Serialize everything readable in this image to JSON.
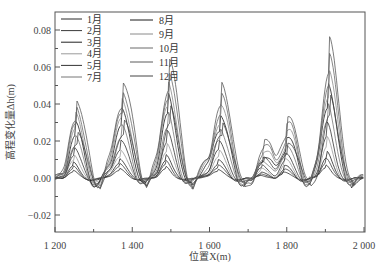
{
  "chart_data": {
    "type": "line",
    "title": "",
    "xlabel": "位置X(m)",
    "ylabel": "高程变化量Δh(m)",
    "xlim": [
      1200,
      2000
    ],
    "ylim": [
      -0.025,
      0.09
    ],
    "x_ticks": [
      1200,
      1400,
      1600,
      1800,
      2000
    ],
    "x_tick_labels": [
      "1 200",
      "1 400",
      "1 600",
      "1 800",
      "2 000"
    ],
    "x_minor_ticks": [
      1300,
      1500,
      1700,
      1900
    ],
    "y_ticks": [
      -0.02,
      0.0,
      0.02,
      0.04,
      0.06,
      0.08
    ],
    "y_tick_labels": [
      "−0.02",
      "0.00",
      "0.02",
      "0.04",
      "0.06",
      "0.08"
    ],
    "grid": false,
    "legend": {
      "position": "upper-left",
      "columns": 2,
      "entries": [
        "1月",
        "2月",
        "3月",
        "4月",
        "5月",
        "7月",
        "8月",
        "9月",
        "10月",
        "11月",
        "12月"
      ]
    },
    "peaks_approx": [
      {
        "x": 1245,
        "max": 0.032
      },
      {
        "x": 1365,
        "max": 0.039
      },
      {
        "x": 1485,
        "max": 0.048
      },
      {
        "x": 1620,
        "max": 0.037
      },
      {
        "x": 1730,
        "max": 0.012
      },
      {
        "x": 1790,
        "max": 0.03
      },
      {
        "x": 1900,
        "max": 0.055
      }
    ],
    "series": [
      {
        "name": "1月",
        "color": "#2a2a2a",
        "scale": 0.1,
        "phase": 0
      },
      {
        "name": "2月",
        "color": "#3a3a3a",
        "scale": 0.15,
        "phase": 1
      },
      {
        "name": "3月",
        "color": "#222222",
        "scale": 0.2,
        "phase": 2
      },
      {
        "name": "4月",
        "color": "#9a9a9a",
        "scale": 0.3,
        "phase": 3
      },
      {
        "name": "5月",
        "color": "#333333",
        "scale": 0.4,
        "phase": 4
      },
      {
        "name": "7月",
        "color": "#777777",
        "scale": 0.55,
        "phase": 5
      },
      {
        "name": "8月",
        "color": "#1a1a1a",
        "scale": 0.7,
        "phase": 6
      },
      {
        "name": "9月",
        "color": "#8a8a8a",
        "scale": 0.8,
        "phase": 7
      },
      {
        "name": "10月",
        "color": "#6a6a6a",
        "scale": 0.9,
        "phase": 8
      },
      {
        "name": "11月",
        "color": "#5a5a5a",
        "scale": 1.0,
        "phase": 9
      },
      {
        "name": "12月",
        "color": "#444444",
        "scale": 0.6,
        "phase": 10
      }
    ]
  }
}
